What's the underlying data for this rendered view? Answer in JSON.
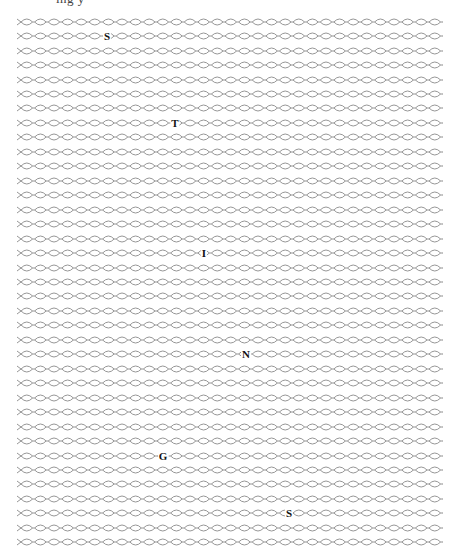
{
  "header": {
    "clipped_text": "ing      y"
  },
  "puzzle": {
    "row_count": 37,
    "first_row_y": 21.7,
    "row_spacing": 14.46,
    "row_x_start": 17,
    "row_x_end": 441,
    "link_width": 13.6,
    "chain_color": "#8a8a8a",
    "letters": [
      {
        "char": "S",
        "row": 1,
        "x": 107
      },
      {
        "char": "T",
        "row": 7,
        "x": 175
      },
      {
        "char": "I",
        "row": 16,
        "x": 204
      },
      {
        "char": "N",
        "row": 23,
        "x": 246
      },
      {
        "char": "G",
        "row": 30,
        "x": 163
      },
      {
        "char": "S",
        "row": 34,
        "x": 289
      }
    ],
    "hidden_word": "STINGS"
  }
}
